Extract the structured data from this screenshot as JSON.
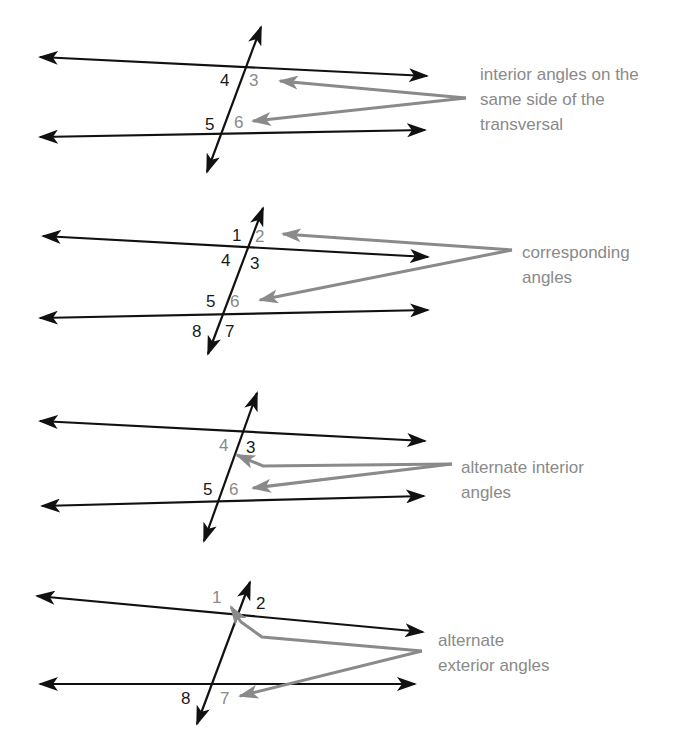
{
  "colors": {
    "line": "#111111",
    "highlight": "#8a8a8a",
    "background": "#ffffff"
  },
  "diagrams": [
    {
      "id": "same-side-interior",
      "caption_lines": [
        "interior angles on the",
        "same side of the",
        "transversal"
      ],
      "labels": [
        {
          "text": "4",
          "highlight": false
        },
        {
          "text": "3",
          "highlight": true
        },
        {
          "text": "5",
          "highlight": false
        },
        {
          "text": "6",
          "highlight": true
        }
      ]
    },
    {
      "id": "corresponding",
      "caption_lines": [
        "corresponding",
        "angles"
      ],
      "labels": [
        {
          "text": "1",
          "highlight": false
        },
        {
          "text": "2",
          "highlight": true
        },
        {
          "text": "4",
          "highlight": false
        },
        {
          "text": "3",
          "highlight": false
        },
        {
          "text": "5",
          "highlight": false
        },
        {
          "text": "6",
          "highlight": true
        },
        {
          "text": "8",
          "highlight": false
        },
        {
          "text": "7",
          "highlight": false
        }
      ]
    },
    {
      "id": "alternate-interior",
      "caption_lines": [
        "alternate interior",
        "angles"
      ],
      "labels": [
        {
          "text": "4",
          "highlight": true
        },
        {
          "text": "3",
          "highlight": false
        },
        {
          "text": "5",
          "highlight": false
        },
        {
          "text": "6",
          "highlight": true
        }
      ]
    },
    {
      "id": "alternate-exterior",
      "caption_lines": [
        "alternate",
        "exterior angles"
      ],
      "labels": [
        {
          "text": "1",
          "highlight": true
        },
        {
          "text": "2",
          "highlight": false
        },
        {
          "text": "8",
          "highlight": false
        },
        {
          "text": "7",
          "highlight": true
        }
      ]
    }
  ]
}
